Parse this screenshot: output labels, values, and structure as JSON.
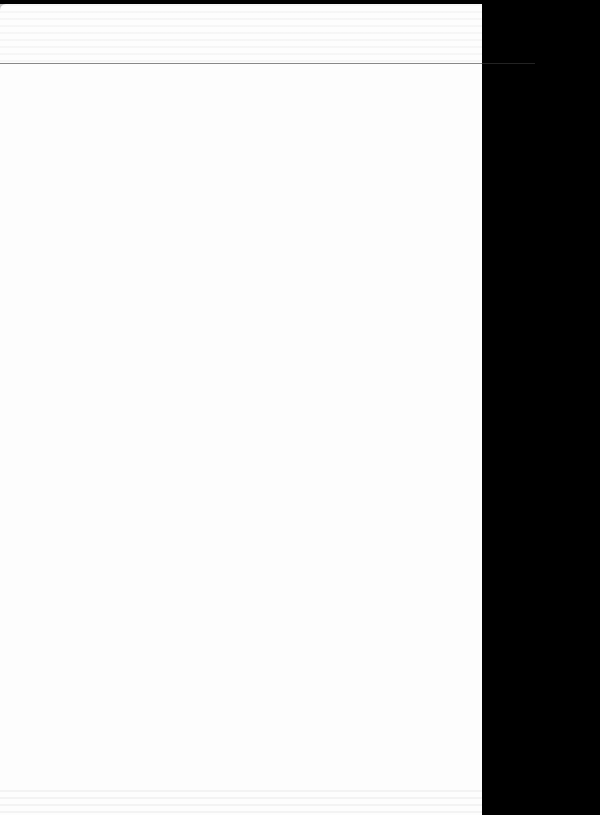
{
  "document": {
    "type": "scanned-page",
    "text_legible": false,
    "colors": {
      "page": "#fdfdfd",
      "background": "#000000"
    }
  }
}
